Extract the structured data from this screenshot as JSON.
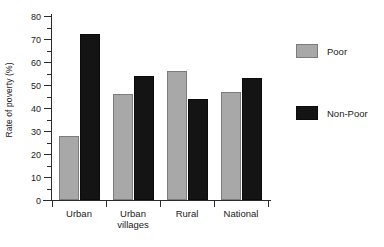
{
  "chart_data": {
    "type": "bar",
    "title": "",
    "xlabel": "",
    "ylabel": "Rate of poverty (%)",
    "ylim": [
      0,
      80
    ],
    "ytick_step": 10,
    "yminor_step": 5,
    "grid": false,
    "legend_position": "right",
    "categories": [
      "Urban",
      "Urban villages",
      "Rural",
      "National"
    ],
    "category_lines": [
      [
        "Urban"
      ],
      [
        "Urban",
        "villages"
      ],
      [
        "Rural"
      ],
      [
        "National"
      ]
    ],
    "ytick_labels": [
      "0",
      "10",
      "20",
      "30",
      "40",
      "50",
      "60",
      "70",
      "80"
    ],
    "series": [
      {
        "name": "Poor",
        "color": "#a8a8a8",
        "values": [
          28,
          46,
          56,
          47
        ]
      },
      {
        "name": "Non-Poor",
        "color": "#141414",
        "values": [
          72,
          54,
          44,
          53
        ]
      }
    ]
  }
}
